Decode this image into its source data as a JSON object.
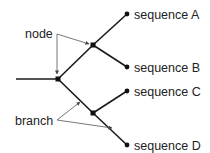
{
  "diagram": {
    "type": "phylogenetic-tree",
    "annotations": {
      "node_label": "node",
      "branch_label": "branch"
    },
    "leaves": [
      {
        "id": "A",
        "label": "sequence A"
      },
      {
        "id": "B",
        "label": "sequence B"
      },
      {
        "id": "C",
        "label": "sequence C"
      },
      {
        "id": "D",
        "label": "sequence D"
      }
    ],
    "colors": {
      "line": "#1a1a1a",
      "arrow": "#555555",
      "text": "#222222",
      "background": "#ffffff"
    }
  }
}
